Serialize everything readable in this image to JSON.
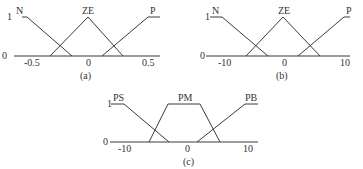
{
  "diagram_a": {
    "caption": "(a)",
    "y_one": "1",
    "y_zero": "0",
    "sets": [
      {
        "label": "N"
      },
      {
        "label": "ZE"
      },
      {
        "label": "P"
      }
    ],
    "ticks": [
      "-0.5",
      "0",
      "0.5"
    ]
  },
  "diagram_b": {
    "caption": "(b)",
    "y_one": "1",
    "y_zero": "0",
    "sets": [
      {
        "label": "N"
      },
      {
        "label": "ZE"
      },
      {
        "label": "P"
      }
    ],
    "ticks": [
      "-10",
      "0",
      "10"
    ]
  },
  "diagram_c": {
    "caption": "(c)",
    "y_one": "1",
    "y_zero": "0",
    "sets": [
      {
        "label": "PS"
      },
      {
        "label": "PM"
      },
      {
        "label": "PB"
      }
    ],
    "ticks": [
      "-10",
      "0",
      "10"
    ]
  }
}
